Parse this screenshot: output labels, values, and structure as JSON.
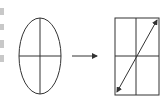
{
  "diagram": {
    "stroke_color": "#333333",
    "left_shape": {
      "type": "ellipse",
      "cx": 40,
      "cy": 56,
      "rx": 21,
      "ry": 38,
      "axes": [
        "vertical",
        "horizontal"
      ]
    },
    "transform_arrow": {
      "x1": 72,
      "y1": 56,
      "x2": 97,
      "y2": 56,
      "direction": "right"
    },
    "right_shape": {
      "type": "rectangle",
      "x": 115,
      "y": 18,
      "width": 44,
      "height": 77,
      "divider_x": 136,
      "divider_y": 56,
      "diagonal": {
        "x1": 117,
        "y1": 92,
        "x2": 157,
        "y2": 20,
        "heads": "both"
      }
    },
    "left_edge_fragments": [
      {
        "y": 8,
        "h": 7
      },
      {
        "y": 24,
        "h": 6
      },
      {
        "y": 40,
        "h": 8
      },
      {
        "y": 55,
        "h": 7
      }
    ]
  }
}
